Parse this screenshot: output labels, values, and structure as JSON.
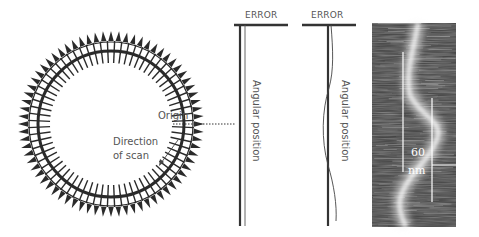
{
  "circle_diagram": {
    "origin_label": "Origin",
    "direction_label_line1": "Direction",
    "direction_label_line2": "of scan",
    "tooth_count": 72,
    "tick_count": 72
  },
  "error_panel_straight": {
    "title": "ERROR",
    "axis_label": "Angular position"
  },
  "error_panel_curved": {
    "title": "ERROR",
    "axis_label": "Angular position"
  },
  "scan_image": {
    "scale_value": "60",
    "scale_unit": "nm"
  },
  "colors": {
    "ink": "#2a2a2a",
    "label": "#555555",
    "background": "#ffffff"
  }
}
